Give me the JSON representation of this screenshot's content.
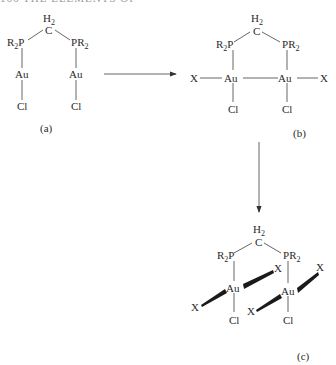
{
  "running_head": "166  THE ELEMENTS OF",
  "structures": {
    "a": {
      "label": "(a)",
      "bridge": {
        "H": "H",
        "H_sub": "2",
        "C": "C"
      },
      "left_p": {
        "R": "R",
        "R_sub": "2",
        "P": "P"
      },
      "right_p": {
        "P": "P",
        "R": "R",
        "R_sub": "2"
      },
      "metal": "Au",
      "halide": "Cl"
    },
    "b": {
      "label": "(b)",
      "bridge": {
        "H": "H",
        "H_sub": "2",
        "C": "C"
      },
      "left_p": {
        "R": "R",
        "R_sub": "2",
        "P": "P"
      },
      "right_p": {
        "P": "P",
        "R": "R",
        "R_sub": "2"
      },
      "metal": "Au",
      "halide": "Cl",
      "ligand": "X"
    },
    "c": {
      "label": "(c)",
      "bridge": {
        "H": "H",
        "H_sub": "2",
        "C": "C"
      },
      "left_p": {
        "R": "R",
        "R_sub": "2",
        "P": "P"
      },
      "right_p": {
        "P": "P",
        "R": "R",
        "R_sub": "2"
      },
      "metal": "Au",
      "halide": "Cl",
      "ligand": "X"
    }
  },
  "arrows": [
    {
      "from": "a",
      "to": "b",
      "direction": "right"
    },
    {
      "from": "b",
      "to": "c",
      "direction": "down"
    }
  ]
}
